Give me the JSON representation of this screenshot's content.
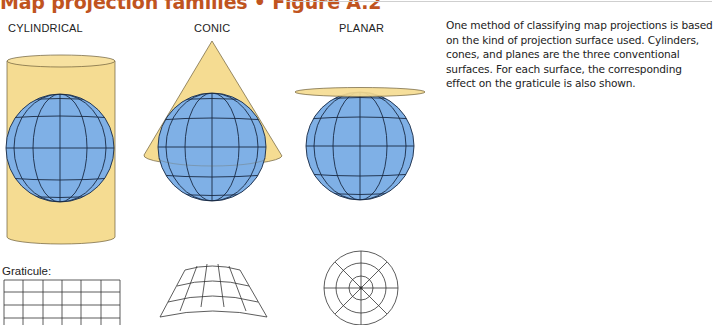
{
  "header": {
    "title": "Map projection families • Figure A.2",
    "accent_color": "#c0541f"
  },
  "columns": [
    {
      "id": "cylindrical",
      "label": "CYLINDRICAL"
    },
    {
      "id": "conic",
      "label": "CONIC"
    },
    {
      "id": "planar",
      "label": "PLANAR"
    }
  ],
  "description": "One method of classifying map projections is based on the kind of projection surface used. Cylinders, cones, and planes are the three conventional surfaces. For each surface, the corresponding effect on the graticule is also shown.",
  "graticule": {
    "label": "Graticule:"
  },
  "colors": {
    "surface_fill": "#f5dc92",
    "globe_fill": "#7fb0e6",
    "line": "#1a2a44"
  }
}
